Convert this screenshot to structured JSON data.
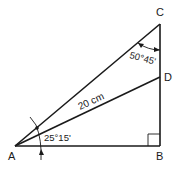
{
  "diagram": {
    "type": "right-triangle-construction",
    "points": {
      "A": "A",
      "B": "B",
      "C": "C",
      "D": "D"
    },
    "segments": [
      "AB",
      "BC",
      "AC",
      "AD"
    ],
    "right_angle_at": "B",
    "labels": {
      "length_AD": "20 cm",
      "angle_at_A": "25°15'",
      "angle_at_C": "50°45'"
    }
  }
}
